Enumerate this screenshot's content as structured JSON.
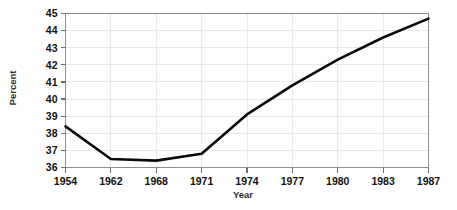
{
  "chart_data": {
    "type": "line",
    "title": "",
    "subtitle": "",
    "xlabel": "Year",
    "ylabel": "Percent",
    "x": [
      1954,
      1962,
      1968,
      1971,
      1974,
      1977,
      1980,
      1983,
      1987
    ],
    "categories": [
      "1954",
      "1962",
      "1968",
      "1971",
      "1974",
      "1977",
      "1980",
      "1983",
      "1987"
    ],
    "values": [
      38.4,
      36.5,
      36.4,
      36.8,
      39.1,
      40.8,
      42.3,
      43.6,
      44.7
    ],
    "series": [
      {
        "name": "Percent",
        "values": [
          38.4,
          36.5,
          36.4,
          36.8,
          39.1,
          40.8,
          42.3,
          43.6,
          44.7
        ]
      }
    ],
    "ylim": [
      36,
      45
    ],
    "yticks": [
      36,
      37,
      38,
      39,
      40,
      41,
      42,
      43,
      44,
      45
    ],
    "ytick_labels": [
      "36",
      "37",
      "38",
      "39",
      "40",
      "41",
      "42",
      "43",
      "44",
      "45"
    ],
    "xtick_labels": [
      "1954",
      "1962",
      "1968",
      "1971",
      "1974",
      "1977",
      "1980",
      "1983",
      "1987"
    ],
    "grid": true,
    "grid_color": "#e9e9e9",
    "legend": false,
    "legend_position": "none",
    "line_color": "#0a0a0a",
    "annotations": []
  },
  "axes": {
    "y_title": "Percent",
    "x_title": "Year"
  }
}
